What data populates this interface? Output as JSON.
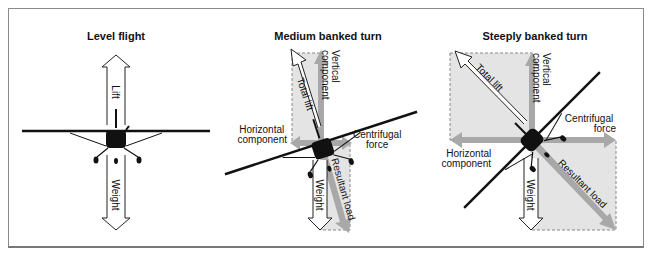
{
  "panels": [
    {
      "title": "Level flight",
      "labels": {
        "lift": "Lift",
        "weight": "Weight"
      }
    },
    {
      "title": "Medium banked turn",
      "labels": {
        "total_lift": "Total lift",
        "vertical_component": [
          "Vertical",
          "component"
        ],
        "horizontal_component": [
          "Horizontal",
          "component"
        ],
        "centrifugal_force": [
          "Centrifugal",
          "force"
        ],
        "weight": "Weight",
        "resultant_load": "Resultant load"
      }
    },
    {
      "title": "Steeply banked turn",
      "labels": {
        "total_lift": "Total lift",
        "vertical_component": [
          "Vertical",
          "component"
        ],
        "horizontal_component": [
          "Horizontal",
          "component"
        ],
        "centrifugal_force": [
          "Centrifugal",
          "force"
        ],
        "weight": "Weight",
        "resultant_load": "Resultant load"
      }
    }
  ],
  "colors": {
    "shade": "#e6e6e6",
    "gray_arrow": "#a9a9a9",
    "frame": "#8a8a8a",
    "ink": "#111111"
  }
}
